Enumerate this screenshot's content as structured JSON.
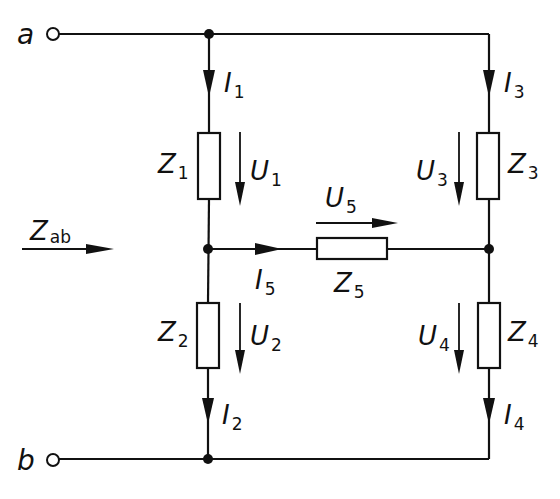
{
  "diagram": {
    "type": "bridge-circuit",
    "terminals": {
      "a": {
        "label": "a"
      },
      "b": {
        "label": "b"
      }
    },
    "input_impedance": {
      "main": "Z",
      "sub": "ab"
    },
    "impedances": [
      {
        "id": "Z1",
        "main": "Z",
        "sub": "1"
      },
      {
        "id": "Z2",
        "main": "Z",
        "sub": "2"
      },
      {
        "id": "Z3",
        "main": "Z",
        "sub": "3"
      },
      {
        "id": "Z4",
        "main": "Z",
        "sub": "4"
      },
      {
        "id": "Z5",
        "main": "Z",
        "sub": "5"
      }
    ],
    "currents": [
      {
        "id": "I1",
        "main": "I",
        "sub": "1"
      },
      {
        "id": "I2",
        "main": "I",
        "sub": "2"
      },
      {
        "id": "I3",
        "main": "I",
        "sub": "3"
      },
      {
        "id": "I4",
        "main": "I",
        "sub": "4"
      },
      {
        "id": "I5",
        "main": "I",
        "sub": "5"
      }
    ],
    "voltages": [
      {
        "id": "U1",
        "main": "U",
        "sub": "1"
      },
      {
        "id": "U2",
        "main": "U",
        "sub": "2"
      },
      {
        "id": "U3",
        "main": "U",
        "sub": "3"
      },
      {
        "id": "U4",
        "main": "U",
        "sub": "4"
      },
      {
        "id": "U5",
        "main": "U",
        "sub": "5"
      }
    ]
  }
}
